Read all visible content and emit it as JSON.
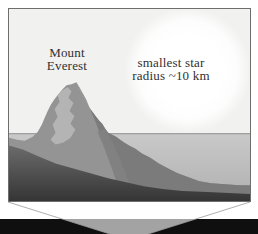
{
  "figure": {
    "panel": {
      "everest_label": {
        "line1": "Mount",
        "line2": "Everest"
      },
      "star_label": {
        "line1": "smallest star",
        "line2": "radius ~10 km"
      }
    },
    "colors": {
      "page_background": "#ffffff",
      "panel_background": "#f1f1f0",
      "panel_border": "#6e6e6e",
      "star_glow": "#ffffff",
      "horizon_line": "#8f8f8f",
      "sea_top": "#c9c9c9",
      "sea_bottom": "#b0b0b0",
      "mountain_left_face": "#949494",
      "mountain_right_face": "#7b7b7b",
      "mountain_snow_band": "#b4b4b4",
      "mountain_spur": "#828282",
      "foreground_top": "#6b6b6b",
      "foreground_bottom": "#353535",
      "scale_bar": "#0f0f0f",
      "funnel_fill": "#ffffff",
      "funnel_line": "#9a9a9a"
    }
  }
}
